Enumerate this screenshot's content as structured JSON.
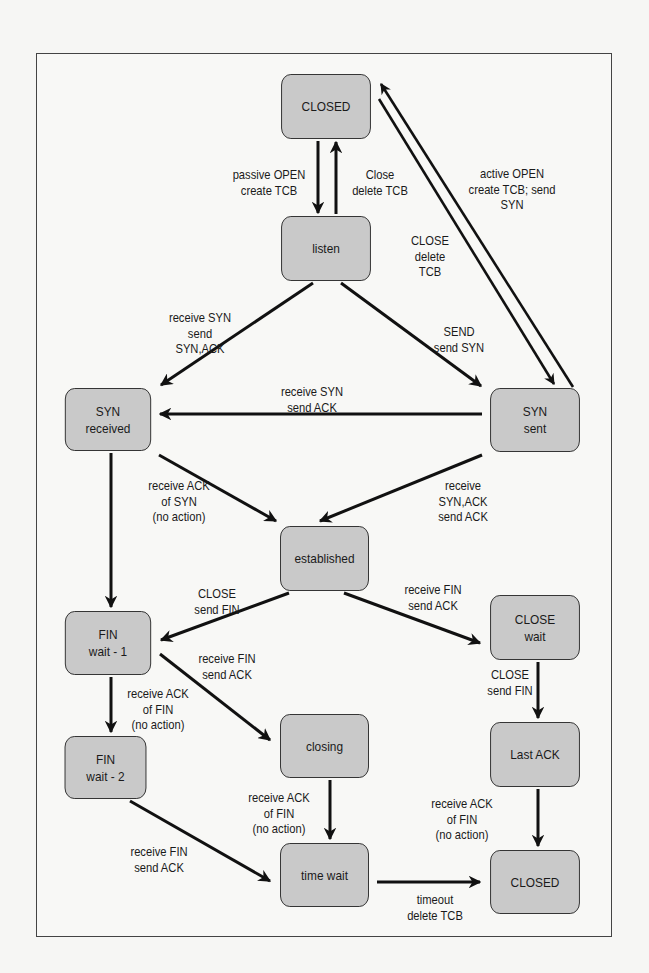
{
  "diagram": {
    "title": "",
    "states": {
      "closed_top": "CLOSED",
      "listen": "listen",
      "syn_received": "SYN\nreceived",
      "syn_sent": "SYN\nsent",
      "established": "established",
      "fin_wait_1": "FIN\nwait - 1",
      "close_wait": "CLOSE\nwait",
      "fin_wait_2": "FIN\nwait - 2",
      "closing": "closing",
      "last_ack": "Last ACK",
      "time_wait": "time wait",
      "closed_bottom": "CLOSED"
    },
    "transitions": {
      "passive_open": "passive OPEN\ncreate TCB",
      "close_delete": "Close\ndelete TCB",
      "active_open": "active OPEN\ncreate TCB; send\nSYN",
      "close_delete_tcb_syn_sent": "CLOSE\ndelete\nTCB",
      "listen_rcv_syn": "receive SYN\nsend\nSYN,ACK",
      "listen_send": "SEND\nsend SYN",
      "synsent_rcv_syn": "receive SYN\nsend ACK",
      "synrcv_rcv_ack": "receive ACK\nof SYN\n(no action)",
      "synsent_rcv_synack": "receive\nSYN,ACK\nsend ACK",
      "est_close": "CLOSE\nsend FIN",
      "est_rcv_fin": "receive FIN\nsend ACK",
      "finwait1_rcv_fin": "receive FIN\nsend ACK",
      "finwait1_rcv_ack": "receive ACK\nof FIN\n(no action)",
      "closewait_close": "CLOSE\nsend FIN",
      "closing_rcv_ack": "receive ACK\nof FIN\n(no action)",
      "lastack_rcv_ack": "receive ACK\nof FIN\n(no action)",
      "finwait2_rcv_fin": "receive FIN\nsend ACK",
      "timeout": "timeout\ndelete TCB"
    }
  }
}
